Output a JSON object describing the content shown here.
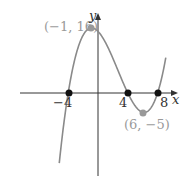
{
  "chart_data": {
    "type": "line",
    "title": "",
    "xlabel": "x",
    "ylabel": "y",
    "function_description": "cubic polynomial with zeros at -4, 4, 8",
    "x_intercepts": [
      -4,
      4,
      8
    ],
    "local_max": {
      "x": -1,
      "y": 16,
      "label": "(−1, 16)"
    },
    "local_min": {
      "x": 6,
      "y": -5,
      "label": "(6, −5)"
    },
    "tick_labels": {
      "x": [
        "−4",
        "4",
        "8"
      ]
    },
    "series": [
      {
        "name": "f(x)",
        "x": [
          -5,
          -4,
          -3,
          -2,
          -1,
          0,
          1,
          2,
          3,
          4,
          5,
          6,
          7,
          8,
          9
        ],
        "values": [
          -31,
          0,
          10.4,
          14.2,
          16,
          15.2,
          12.4,
          8.5,
          4.1,
          0,
          -3.3,
          -5,
          -3.9,
          0,
          7.7
        ]
      }
    ],
    "colors": {
      "curve": "#8a8a8a",
      "axis": "#333333",
      "intercept_point": "#111111",
      "extremum_point": "#999999",
      "extremum_label": "#999999"
    },
    "grid": false,
    "legend": null
  },
  "labels": {
    "y_axis": "y",
    "x_axis": "x",
    "max_point": "(−1, 16)",
    "min_point": "(6, −5)",
    "tick_neg4": "−4",
    "tick_4": "4",
    "tick_8": "8"
  }
}
